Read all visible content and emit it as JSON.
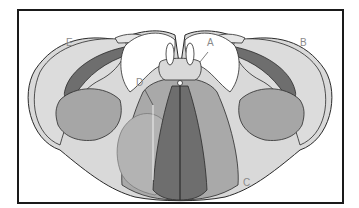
{
  "figure": {
    "type": "anatomical cross-section diagram",
    "labels": [
      {
        "id": "A",
        "text": "A"
      },
      {
        "id": "B",
        "text": "B"
      },
      {
        "id": "C",
        "text": "C"
      },
      {
        "id": "D",
        "text": "D"
      },
      {
        "id": "E",
        "text": "E"
      }
    ],
    "colors": {
      "frame": "#1a1a1a",
      "outline": "#2a2a2a",
      "light_gray": "#d9d9d9",
      "mid_gray": "#a6a6a6",
      "dark_gray": "#6e6e6e",
      "label": "#8a8a8a",
      "background": "#ffffff"
    }
  }
}
